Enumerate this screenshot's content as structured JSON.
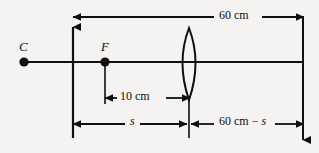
{
  "diagram": {
    "background_color": "#f4f3f1",
    "stroke_color": "#100f0d",
    "points": [
      {
        "id": "C",
        "label": "C",
        "x": 24,
        "y": 62,
        "label_x": 19,
        "label_y": 40
      },
      {
        "id": "F",
        "label": "F",
        "x": 105,
        "y": 62,
        "label_x": 101,
        "label_y": 40
      }
    ],
    "lens": {
      "name": "biconvex-lens",
      "center_x": 189,
      "top_y": 28,
      "bottom_y": 100,
      "bulge": 13
    },
    "axis": {
      "y": 62,
      "x_start": 24,
      "x_end": 303
    },
    "dimensions": [
      {
        "id": "total",
        "label": "60 cm",
        "label_x": 228,
        "label_y": 11,
        "y": 17,
        "x_start": 73,
        "x_end": 303
      },
      {
        "id": "focal",
        "label": "10 cm",
        "label_x": 129,
        "label_y": 91,
        "y": 98,
        "x_start": 105,
        "x_end": 189
      },
      {
        "id": "object",
        "label": "s",
        "label_x": 131,
        "label_y": 115,
        "y": 124,
        "x_start": 73,
        "x_end": 186
      },
      {
        "id": "image",
        "label": "60 cm − s",
        "label_x": 228,
        "label_y": 115,
        "y": 124,
        "x_start": 192,
        "x_end": 303
      }
    ],
    "object_arrow": {
      "name": "object-arrow",
      "x": 73,
      "base_y": 138,
      "tip_y": 27
    }
  }
}
